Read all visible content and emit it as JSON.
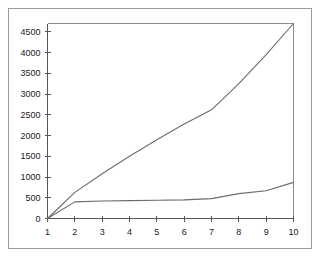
{
  "chart_data": {
    "type": "line",
    "title": "",
    "subtitle": "",
    "xlabel": "",
    "ylabel": "",
    "x": [
      1,
      2,
      3,
      4,
      5,
      6,
      7,
      8,
      9,
      10
    ],
    "xlim": [
      1,
      10
    ],
    "ylim": [
      0,
      4700
    ],
    "yticks": [
      0,
      500,
      1000,
      1500,
      2000,
      2500,
      3000,
      3500,
      4000,
      4500
    ],
    "ytick_labels": [
      "0",
      "500",
      "1000",
      "1500",
      "2000",
      "2500",
      "3000",
      "3500",
      "4000",
      "4500"
    ],
    "xticks": [
      1,
      2,
      3,
      4,
      5,
      6,
      7,
      8,
      9,
      10
    ],
    "xtick_labels": [
      "1",
      "2",
      "3",
      "4",
      "5",
      "6",
      "7",
      "8",
      "9",
      "10"
    ],
    "grid": false,
    "legend": "none",
    "series": [
      {
        "name": "upper-curve",
        "color": "#6b6b6b",
        "values": [
          0,
          630,
          1080,
          1500,
          1900,
          2280,
          2620,
          3250,
          3950,
          4700
        ]
      },
      {
        "name": "lower-curve",
        "color": "#6b6b6b",
        "values": [
          0,
          400,
          420,
          430,
          440,
          450,
          480,
          600,
          670,
          870
        ]
      }
    ]
  },
  "figure": {
    "background_color": "#ffffff",
    "frame_color": "#9a9a9a",
    "axis_color": "#555555",
    "line_color": "#6b6b6b"
  }
}
